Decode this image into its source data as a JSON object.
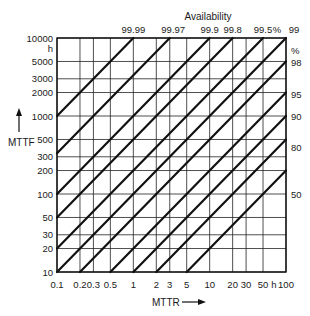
{
  "chart_data": {
    "type": "line",
    "title": "Availability",
    "xlabel": "MTTR",
    "ylabel": "MTTF",
    "x_unit": "h",
    "y_unit": "h",
    "xscale": "log",
    "yscale": "log",
    "xlim": [
      0.1,
      100
    ],
    "ylim": [
      10,
      10000
    ],
    "grid": true,
    "x_ticks": [
      0.1,
      0.2,
      0.3,
      0.5,
      1,
      2,
      3,
      5,
      10,
      20,
      30,
      50,
      100
    ],
    "x_tick_labels": [
      "0.1",
      "0.2",
      "0.3",
      "0.5",
      "1",
      "2",
      "3",
      "5",
      "10",
      "20",
      "30",
      "50",
      "h",
      "100"
    ],
    "y_ticks": [
      10,
      20,
      30,
      50,
      100,
      200,
      300,
      500,
      1000,
      2000,
      3000,
      5000,
      10000
    ],
    "y_tick_labels": [
      "10",
      "20",
      "30",
      "50",
      "100",
      "200",
      "300",
      "500",
      "1000",
      "2000",
      "3000",
      "5000",
      "h",
      "10000"
    ],
    "top_labels": [
      {
        "text": "99.99",
        "x": 1
      },
      {
        "text": "99.97",
        "x": 3.33
      },
      {
        "text": "99.9",
        "x": 10
      },
      {
        "text": "99.8",
        "x": 20
      },
      {
        "text": "99.5",
        "x": 50
      },
      {
        "text": "%",
        "x": 76
      },
      {
        "text": "99",
        "x": 100
      }
    ],
    "right_labels": [
      {
        "text": "%",
        "y": 7000
      },
      {
        "text": "98",
        "y": 4900
      },
      {
        "text": "95",
        "y": 1900
      },
      {
        "text": "90",
        "y": 980
      },
      {
        "text": "80",
        "y": 400
      },
      {
        "text": "50",
        "y": 100
      }
    ],
    "series": [
      {
        "name": "99.99%",
        "availability": 99.99,
        "mttf_over_mttr": 9999
      },
      {
        "name": "99.97%",
        "availability": 99.97,
        "mttf_over_mttr": 3332
      },
      {
        "name": "99.9%",
        "availability": 99.9,
        "mttf_over_mttr": 999
      },
      {
        "name": "99.8%",
        "availability": 99.8,
        "mttf_over_mttr": 499
      },
      {
        "name": "99.5%",
        "availability": 99.5,
        "mttf_over_mttr": 199
      },
      {
        "name": "99%",
        "availability": 99,
        "mttf_over_mttr": 99
      },
      {
        "name": "98%",
        "availability": 98,
        "mttf_over_mttr": 49
      },
      {
        "name": "95%",
        "availability": 95,
        "mttf_over_mttr": 19
      },
      {
        "name": "90%",
        "availability": 90,
        "mttf_over_mttr": 9
      },
      {
        "name": "80%",
        "availability": 80,
        "mttf_over_mttr": 4
      },
      {
        "name": "50%",
        "availability": 50,
        "mttf_over_mttr": 1
      }
    ],
    "annotations": [
      "MTTF ↑",
      "MTTR →"
    ]
  },
  "labels": {
    "title": "Availability",
    "y_axis": "MTTF",
    "x_axis": "MTTR"
  },
  "style": {
    "line_color": "#111111",
    "grid_color": "#222222",
    "background": "#ffffff"
  }
}
